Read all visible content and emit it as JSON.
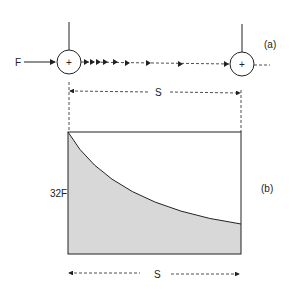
{
  "figure": {
    "part_a": {
      "label": "(a)",
      "force_label": "F",
      "distance_label": "S",
      "center_symbol": "+"
    },
    "part_b": {
      "label": "(b)",
      "y_value_label": "32F",
      "distance_label": "S"
    },
    "colors": {
      "line": "#222222",
      "fill": "#d8d8d8",
      "background": "#ffffff"
    }
  }
}
